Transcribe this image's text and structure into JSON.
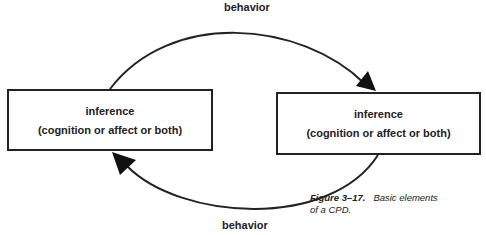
{
  "diagram": {
    "top_arrow_label": "behavior",
    "bottom_arrow_label": "behavior",
    "left_box": {
      "title": "inference",
      "subtitle": "(cognition or affect or both)"
    },
    "right_box": {
      "title": "inference",
      "subtitle": "(cognition or affect or both)"
    },
    "caption": {
      "figure_number": "Figure 3–17.",
      "text_line1": "Basic elements",
      "text_line2": "of a CPD."
    },
    "colors": {
      "stroke": "#222222",
      "background": "#ffffff"
    }
  }
}
